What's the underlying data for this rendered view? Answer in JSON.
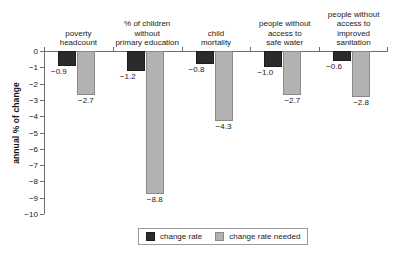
{
  "chart_data": {
    "type": "bar",
    "title": "",
    "xlabel": "",
    "ylabel": "annual % of change",
    "ylim": [
      -10,
      0
    ],
    "grid": false,
    "legend_position": "bottom-center",
    "categories": [
      "poverty\nheadcount",
      "% of children\nwithout\nprimary education",
      "child\nmortality",
      "people without\naccess to\nsafe water",
      "people without\naccess to\nimproved sanitation"
    ],
    "category_lines": [
      [
        "poverty",
        "headcount"
      ],
      [
        "% of children",
        "without",
        "primary education"
      ],
      [
        "child",
        "mortality"
      ],
      [
        "people without",
        "access to",
        "safe water"
      ],
      [
        "people without",
        "access to",
        "improved sanitation"
      ]
    ],
    "series": [
      {
        "name": "change rate",
        "color": "#2b2b2b",
        "values": [
          -0.9,
          -1.2,
          -0.8,
          -1.0,
          -0.6
        ],
        "labels": [
          "−0.9",
          "−1.2",
          "−0.8",
          "−1.0",
          "−0.6"
        ]
      },
      {
        "name": "change rate needed",
        "color": "#b2b2b2",
        "values": [
          -2.7,
          -8.8,
          -4.3,
          -2.7,
          -2.8
        ],
        "labels": [
          "−2.7",
          "−8.8",
          "−4.3",
          "−2.7",
          "−2.8"
        ]
      }
    ],
    "ticks": [
      {
        "value": 0,
        "label": "0"
      },
      {
        "value": -1,
        "label": "−1"
      },
      {
        "value": -2,
        "label": "−2"
      },
      {
        "value": -3,
        "label": "−3"
      },
      {
        "value": -4,
        "label": "−4"
      },
      {
        "value": -5,
        "label": "−5"
      },
      {
        "value": -6,
        "label": "−6"
      },
      {
        "value": -7,
        "label": "−7"
      },
      {
        "value": -8,
        "label": "−8"
      },
      {
        "value": -9,
        "label": "−9"
      },
      {
        "value": -10,
        "label": "−10"
      }
    ]
  },
  "legend": {
    "items": [
      {
        "label": "change rate",
        "swatch": "dark"
      },
      {
        "label": "change rate needed",
        "swatch": "light"
      }
    ]
  },
  "footnote": ""
}
